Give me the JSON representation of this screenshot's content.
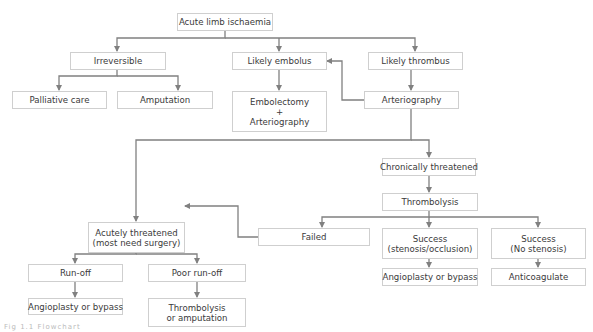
{
  "diagram": {
    "type": "flowchart",
    "colors": {
      "line": "#808080",
      "box_border": "#cfcfcf",
      "text": "#3a3a3a",
      "background": "#ffffff"
    },
    "nodes": {
      "acute_limb_ischaemia": {
        "lines": [
          "Acute limb ischaemia"
        ]
      },
      "irreversible": {
        "lines": [
          "Irreversible"
        ]
      },
      "likely_embolus": {
        "lines": [
          "Likely embolus"
        ]
      },
      "likely_thrombus": {
        "lines": [
          "Likely thrombus"
        ]
      },
      "palliative_care": {
        "lines": [
          "Palliative care"
        ]
      },
      "amputation": {
        "lines": [
          "Amputation"
        ]
      },
      "embolectomy": {
        "lines": [
          "Embolectomy",
          "+",
          "Arteriography"
        ]
      },
      "arteriography": {
        "lines": [
          "Arteriography"
        ]
      },
      "chronically_threatened": {
        "lines": [
          "Chronically threatened"
        ]
      },
      "thrombolysis": {
        "lines": [
          "Thrombolysis"
        ]
      },
      "acutely_threatened": {
        "lines": [
          "Acutely threatened",
          "(most need surgery)"
        ]
      },
      "failed": {
        "lines": [
          "Failed"
        ]
      },
      "success_stenosis": {
        "lines": [
          "Success",
          "(stenosis/occlusion)"
        ]
      },
      "success_no_stenosis": {
        "lines": [
          "Success",
          "(No stenosis)"
        ]
      },
      "run_off": {
        "lines": [
          "Run-off"
        ]
      },
      "poor_run_off": {
        "lines": [
          "Poor run-off"
        ]
      },
      "angioplasty_left": {
        "lines": [
          "Angioplasty or bypass"
        ]
      },
      "thrombolysis_or_amputation": {
        "lines": [
          "Thrombolysis",
          "or amputation"
        ]
      },
      "angioplasty_right": {
        "lines": [
          "Angioplasty or bypass"
        ]
      },
      "anticoagulate": {
        "lines": [
          "Anticoagulate"
        ]
      }
    },
    "edges": [
      {
        "from": "acute_limb_ischaemia",
        "to": "irreversible"
      },
      {
        "from": "acute_limb_ischaemia",
        "to": "likely_embolus"
      },
      {
        "from": "acute_limb_ischaemia",
        "to": "likely_thrombus"
      },
      {
        "from": "irreversible",
        "to": "palliative_care"
      },
      {
        "from": "irreversible",
        "to": "amputation"
      },
      {
        "from": "likely_embolus",
        "to": "embolectomy"
      },
      {
        "from": "likely_thrombus",
        "to": "arteriography"
      },
      {
        "from": "arteriography",
        "to": "likely_embolus"
      },
      {
        "from": "arteriography",
        "to": "acutely_threatened"
      },
      {
        "from": "arteriography",
        "to": "chronically_threatened"
      },
      {
        "from": "chronically_threatened",
        "to": "thrombolysis"
      },
      {
        "from": "thrombolysis",
        "to": "failed"
      },
      {
        "from": "thrombolysis",
        "to": "success_stenosis"
      },
      {
        "from": "thrombolysis",
        "to": "success_no_stenosis"
      },
      {
        "from": "failed",
        "to": "acutely_threatened"
      },
      {
        "from": "acutely_threatened",
        "to": "run_off"
      },
      {
        "from": "acutely_threatened",
        "to": "poor_run_off"
      },
      {
        "from": "run_off",
        "to": "angioplasty_left"
      },
      {
        "from": "poor_run_off",
        "to": "thrombolysis_or_amputation"
      },
      {
        "from": "success_stenosis",
        "to": "angioplasty_right"
      },
      {
        "from": "success_no_stenosis",
        "to": "anticoagulate"
      }
    ],
    "caption": "Fig 1.1 Flowchart"
  }
}
